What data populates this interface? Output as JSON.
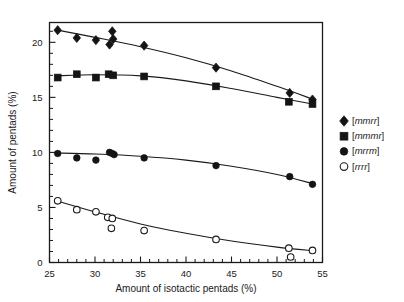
{
  "chart_data": {
    "type": "scatter",
    "title": "",
    "xlabel": "Amount of isotactic pentads (%)",
    "ylabel": "Amount of pentads (%)",
    "xlim": [
      25,
      55
    ],
    "ylim": [
      0,
      21.8
    ],
    "xticks": [
      25,
      30,
      35,
      40,
      45,
      50,
      55
    ],
    "xticklabels": [
      "25",
      "30",
      "35",
      "40",
      "45",
      "50",
      "55"
    ],
    "yticks": [
      0,
      5,
      10,
      15,
      20
    ],
    "yticklabels": [
      "0",
      "5",
      "10",
      "15",
      "20"
    ],
    "x_minor_interval": 1,
    "y_minor_interval": 1,
    "grid": false,
    "legend_position": "right",
    "series": [
      {
        "name": "[mmrr]",
        "label_bracket_open": "[",
        "label_bracket_close": "]",
        "label_italic": "mmrr",
        "marker": "diamond",
        "filled": true,
        "color": "#141414",
        "points": [
          {
            "x": 25.9,
            "y": 21.1
          },
          {
            "x": 28.0,
            "y": 20.4
          },
          {
            "x": 30.1,
            "y": 20.2
          },
          {
            "x": 31.6,
            "y": 19.8
          },
          {
            "x": 31.9,
            "y": 21.0
          },
          {
            "x": 32.0,
            "y": 20.3
          },
          {
            "x": 35.4,
            "y": 19.7
          },
          {
            "x": 43.3,
            "y": 17.7
          },
          {
            "x": 51.4,
            "y": 15.4
          },
          {
            "x": 53.9,
            "y": 14.8
          }
        ],
        "fit": [
          {
            "x": 25.6,
            "y": 21.15
          },
          {
            "x": 30.0,
            "y": 20.45
          },
          {
            "x": 35.0,
            "y": 19.6
          },
          {
            "x": 40.0,
            "y": 18.6
          },
          {
            "x": 45.0,
            "y": 17.4
          },
          {
            "x": 50.0,
            "y": 16.0
          },
          {
            "x": 54.2,
            "y": 14.75
          }
        ]
      },
      {
        "name": "[mmmr]",
        "label_bracket_open": "[",
        "label_bracket_close": "]",
        "label_italic": "mmmr",
        "marker": "square",
        "filled": true,
        "color": "#141414",
        "points": [
          {
            "x": 25.9,
            "y": 16.8
          },
          {
            "x": 28.0,
            "y": 17.1
          },
          {
            "x": 30.1,
            "y": 16.8
          },
          {
            "x": 31.5,
            "y": 17.1
          },
          {
            "x": 32.0,
            "y": 17.0
          },
          {
            "x": 35.4,
            "y": 16.9
          },
          {
            "x": 43.3,
            "y": 16.0
          },
          {
            "x": 51.3,
            "y": 14.6
          },
          {
            "x": 53.9,
            "y": 14.4
          }
        ],
        "fit": [
          {
            "x": 25.6,
            "y": 16.95
          },
          {
            "x": 30.0,
            "y": 17.05
          },
          {
            "x": 35.0,
            "y": 16.95
          },
          {
            "x": 40.0,
            "y": 16.5
          },
          {
            "x": 45.0,
            "y": 15.8
          },
          {
            "x": 50.0,
            "y": 15.0
          },
          {
            "x": 54.2,
            "y": 14.35
          }
        ]
      },
      {
        "name": "[mrrm]",
        "label_bracket_open": "[",
        "label_bracket_close": "]",
        "label_italic": "mrrm",
        "marker": "circle",
        "filled": true,
        "color": "#141414",
        "points": [
          {
            "x": 25.9,
            "y": 9.9
          },
          {
            "x": 28.0,
            "y": 9.5
          },
          {
            "x": 30.1,
            "y": 9.3
          },
          {
            "x": 31.6,
            "y": 10.0
          },
          {
            "x": 31.9,
            "y": 9.9
          },
          {
            "x": 32.1,
            "y": 9.8
          },
          {
            "x": 35.4,
            "y": 9.5
          },
          {
            "x": 43.3,
            "y": 8.8
          },
          {
            "x": 51.4,
            "y": 7.8
          },
          {
            "x": 53.9,
            "y": 7.1
          }
        ],
        "fit": [
          {
            "x": 25.6,
            "y": 9.95
          },
          {
            "x": 30.0,
            "y": 9.85
          },
          {
            "x": 35.0,
            "y": 9.65
          },
          {
            "x": 40.0,
            "y": 9.3
          },
          {
            "x": 45.0,
            "y": 8.75
          },
          {
            "x": 50.0,
            "y": 8.0
          },
          {
            "x": 54.2,
            "y": 7.1
          }
        ]
      },
      {
        "name": "[rrrr]",
        "label_bracket_open": "[",
        "label_bracket_close": "]",
        "label_italic": "rrrr",
        "marker": "circle",
        "filled": false,
        "color": "#1a1a1a",
        "points": [
          {
            "x": 25.9,
            "y": 5.6
          },
          {
            "x": 28.0,
            "y": 4.8
          },
          {
            "x": 30.1,
            "y": 4.6
          },
          {
            "x": 31.4,
            "y": 4.1
          },
          {
            "x": 31.9,
            "y": 4.0
          },
          {
            "x": 31.8,
            "y": 3.1
          },
          {
            "x": 35.4,
            "y": 2.9
          },
          {
            "x": 43.3,
            "y": 2.1
          },
          {
            "x": 51.3,
            "y": 1.3
          },
          {
            "x": 51.5,
            "y": 0.5
          },
          {
            "x": 53.9,
            "y": 1.1
          }
        ],
        "fit": [
          {
            "x": 25.6,
            "y": 5.65
          },
          {
            "x": 30.0,
            "y": 4.6
          },
          {
            "x": 35.0,
            "y": 3.5
          },
          {
            "x": 40.0,
            "y": 2.65
          },
          {
            "x": 45.0,
            "y": 1.95
          },
          {
            "x": 50.0,
            "y": 1.4
          },
          {
            "x": 54.2,
            "y": 1.05
          }
        ]
      }
    ]
  }
}
